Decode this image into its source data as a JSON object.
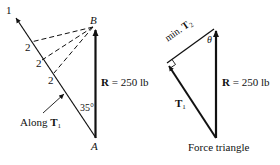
{
  "diagram": {
    "left_figure": {
      "line_label": "1",
      "point_top": "B",
      "point_bottom": "A",
      "dash_labels": [
        "2",
        "2",
        "2"
      ],
      "angle_label": "35°",
      "resultant_label_bold": "R",
      "resultant_label_rest": " = 250 lb",
      "along_label_text": "Along ",
      "along_label_vector": "T",
      "along_label_sub": "1"
    },
    "right_figure": {
      "min_label_text": "min. ",
      "min_label_vector": "T",
      "min_label_sub": "2",
      "theta_label": "θ",
      "t1_vector": "T",
      "t1_sub": "1",
      "resultant_label_bold": "R",
      "resultant_label_rest": " = 250 lb",
      "caption": "Force triangle"
    },
    "colors": {
      "ink": "#111111",
      "background": "#ffffff"
    }
  }
}
